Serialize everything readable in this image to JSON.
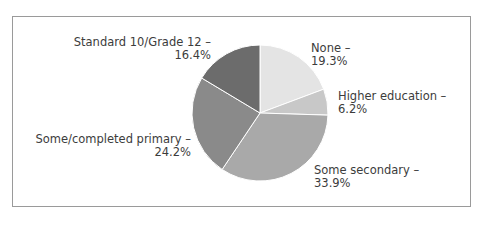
{
  "chart_data": {
    "type": "pie",
    "title": "",
    "categories": [
      "None",
      "Higher education",
      "Some secondary",
      "Some/completed primary",
      "Standard 10/Grade 12"
    ],
    "values": [
      19.3,
      6.2,
      33.9,
      24.2,
      16.4
    ],
    "unit": "%",
    "colors": [
      "#e4e4e4",
      "#c8c8c8",
      "#a9a9a9",
      "#8a8a8a",
      "#6c6c6c"
    ],
    "start_angle": "12 o'clock, clockwise",
    "legend": "none (direct labels)",
    "labels": [
      {
        "name": "None –",
        "value": "19.3%"
      },
      {
        "name": "Higher education –",
        "value": "6.2%"
      },
      {
        "name": "Some secondary –",
        "value": "33.9%"
      },
      {
        "name": "Some/completed primary –",
        "value": "24.2%"
      },
      {
        "name": "Standard 10/Grade 12 –",
        "value": "16.4%"
      }
    ]
  }
}
